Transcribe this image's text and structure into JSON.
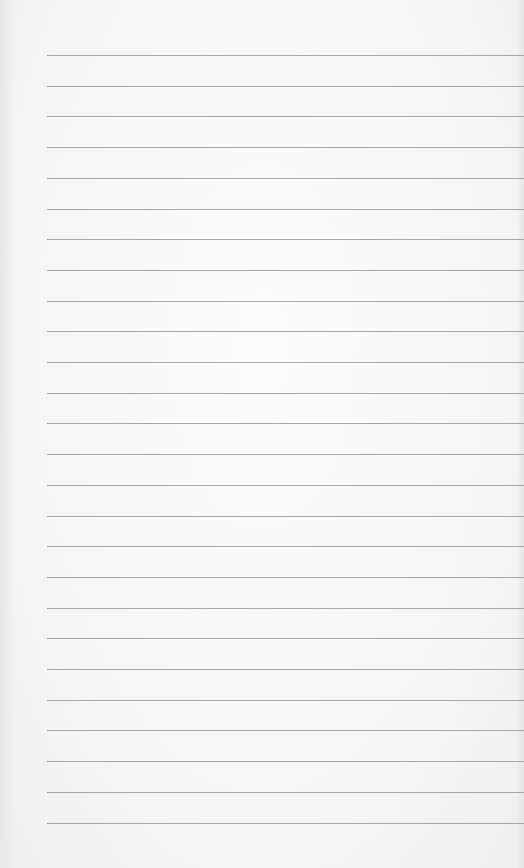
{
  "paper": {
    "type": "lined-notebook-page",
    "line_count": 26,
    "first_line_y": 55,
    "line_spacing": 30.7,
    "line_left_x": 47,
    "line_color": "#9a9a9a",
    "background_color": "#f6f6f6"
  }
}
